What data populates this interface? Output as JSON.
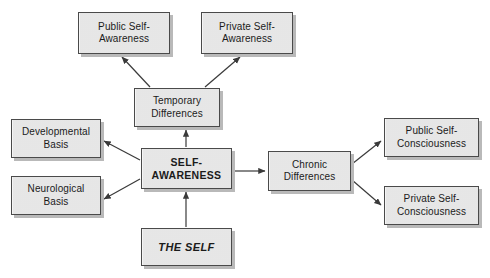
{
  "diagram": {
    "title_text": "",
    "canvas": {
      "width": 490,
      "height": 278,
      "background": "#ffffff"
    },
    "style": {
      "node_fill": "#e9e9e9",
      "node_border": "#4a4a4a",
      "node_shadow": "#b9b9b9",
      "edge_color": "#3a3a3a",
      "text_color": "#1b1b1b"
    },
    "nodes": [
      {
        "id": "public-self-awareness",
        "label": "Public Self-\nAwareness",
        "x": 78,
        "y": 12,
        "w": 92,
        "h": 42,
        "emphasis": "normal"
      },
      {
        "id": "private-self-awareness",
        "label": "Private Self-\nAwareness",
        "x": 201,
        "y": 12,
        "w": 92,
        "h": 42,
        "emphasis": "normal"
      },
      {
        "id": "temporary-differences",
        "label": "Temporary\nDifferences",
        "x": 134,
        "y": 88,
        "w": 86,
        "h": 39,
        "emphasis": "normal"
      },
      {
        "id": "developmental-basis",
        "label": "Developmental\nBasis",
        "x": 11,
        "y": 119,
        "w": 90,
        "h": 39,
        "emphasis": "normal"
      },
      {
        "id": "neurological-basis",
        "label": "Neurological\nBasis",
        "x": 11,
        "y": 176,
        "w": 90,
        "h": 39,
        "emphasis": "normal"
      },
      {
        "id": "self-awareness",
        "label": "SELF-\nAWARENESS",
        "x": 141,
        "y": 148,
        "w": 91,
        "h": 41,
        "emphasis": "bold"
      },
      {
        "id": "chronic-differences",
        "label": "Chronic\nDifferences",
        "x": 268,
        "y": 151,
        "w": 83,
        "h": 40,
        "emphasis": "normal"
      },
      {
        "id": "public-self-consciousness",
        "label": "Public Self-\nConsciousness",
        "x": 384,
        "y": 118,
        "w": 95,
        "h": 39,
        "emphasis": "normal"
      },
      {
        "id": "private-self-consciousness",
        "label": "Private Self-\nConsciousness",
        "x": 384,
        "y": 186,
        "w": 95,
        "h": 39,
        "emphasis": "normal"
      },
      {
        "id": "the-self",
        "label": "THE SELF",
        "x": 141,
        "y": 228,
        "w": 91,
        "h": 38,
        "emphasis": "bold-italic"
      }
    ],
    "edges": [
      {
        "from": "temporary-differences",
        "to": "public-self-awareness",
        "x1": 150,
        "y1": 87,
        "x2": 122,
        "y2": 57,
        "label": ""
      },
      {
        "from": "temporary-differences",
        "to": "private-self-awareness",
        "x1": 205,
        "y1": 87,
        "x2": 240,
        "y2": 57,
        "label": ""
      },
      {
        "from": "self-awareness",
        "to": "temporary-differences",
        "x1": 186,
        "y1": 147,
        "x2": 186,
        "y2": 130,
        "label": ""
      },
      {
        "from": "self-awareness",
        "to": "developmental-basis",
        "x1": 140,
        "y1": 160,
        "x2": 104,
        "y2": 141,
        "label": ""
      },
      {
        "from": "self-awareness",
        "to": "neurological-basis",
        "x1": 140,
        "y1": 179,
        "x2": 104,
        "y2": 199,
        "label": ""
      },
      {
        "from": "self-awareness",
        "to": "chronic-differences",
        "x1": 233,
        "y1": 171,
        "x2": 265,
        "y2": 171,
        "label": ""
      },
      {
        "from": "chronic-differences",
        "to": "public-self-consciousness",
        "x1": 352,
        "y1": 164,
        "x2": 381,
        "y2": 141,
        "label": ""
      },
      {
        "from": "chronic-differences",
        "to": "private-self-consciousness",
        "x1": 352,
        "y1": 180,
        "x2": 381,
        "y2": 205,
        "label": ""
      },
      {
        "from": "the-self",
        "to": "self-awareness",
        "x1": 186,
        "y1": 227,
        "x2": 186,
        "y2": 192,
        "label": ""
      }
    ]
  }
}
